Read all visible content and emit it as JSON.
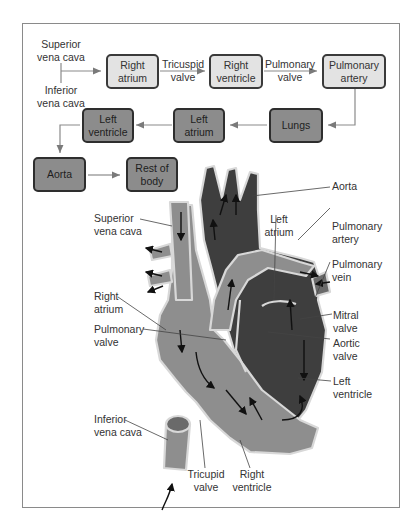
{
  "flowchart": {
    "inputs": {
      "superior": "Superior\nvena cava",
      "inferior": "Inferior\nvena cava"
    },
    "boxes": [
      {
        "id": "right-atrium",
        "label": "Right\natrium",
        "tone": "light"
      },
      {
        "id": "right-ventricle",
        "label": "Right\nventricle",
        "tone": "light"
      },
      {
        "id": "pulmonary-artery",
        "label": "Pulmonary\nartery",
        "tone": "light"
      },
      {
        "id": "lungs",
        "label": "Lungs",
        "tone": "dark"
      },
      {
        "id": "left-atrium",
        "label": "Left\natrium",
        "tone": "dark"
      },
      {
        "id": "left-ventricle",
        "label": "Left\nventricle",
        "tone": "dark"
      },
      {
        "id": "aorta",
        "label": "Aorta",
        "tone": "dark"
      },
      {
        "id": "rest-of-body",
        "label": "Rest of\nbody",
        "tone": "dark"
      }
    ],
    "edge_labels": {
      "tricuspid": "Tricuspid\nvalve",
      "pulmonary": "Pulmonary\nvalve"
    }
  },
  "heart": {
    "labels": {
      "superior_vena_cava": "Superior\nvena cava",
      "right_atrium": "Right\natrium",
      "pulmonary_valve": "Pulmonary\nvalve",
      "inferior_vena_cava": "Inferior\nvena cava",
      "tricuspid_valve": "Tricupid\nvalve",
      "right_ventricle": "Right\nventricle",
      "aorta": "Aorta",
      "left_atrium": "Left\natrium",
      "pulmonary_artery": "Pulmonary\nartery",
      "pulmonary_vein": "Pulmonary\nvein",
      "mitral_valve": "Mitral\nvalve",
      "aortic_valve": "Aortic\nvalve",
      "left_ventricle": "Left\nventricle"
    }
  },
  "colors": {
    "deoxygenated": "#8c8c8c",
    "oxygenated": "#3c3c3c",
    "box_light": "#e3e3e3",
    "box_dark": "#8c8c8c",
    "frame": "#8a8a8a"
  }
}
